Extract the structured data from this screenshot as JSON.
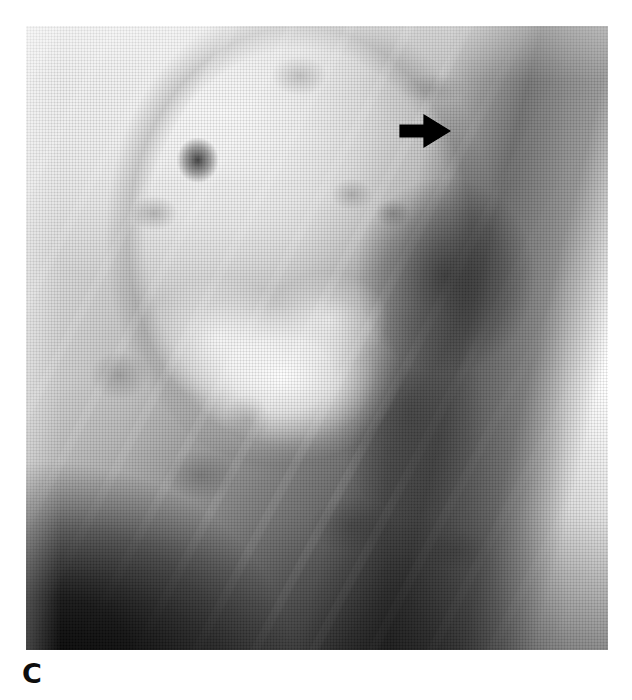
{
  "figure": {
    "panel_label": "C",
    "caption": "",
    "modality": "radiograph",
    "view": "lateral chest radiograph"
  },
  "image": {
    "name": "chest-radiograph",
    "alt_text": "Grayscale halftone chest radiograph, lateral projection",
    "frame": {
      "left": 26,
      "top": 26,
      "width": 582,
      "height": 624
    },
    "tones": {
      "background": "#ffffff",
      "film_light": "#e8e8e8",
      "film_mid": "#9e9e9e",
      "film_dark": "#232323",
      "film_black": "#000000",
      "highlight": "#ffffff"
    }
  },
  "annotations": [
    {
      "name": "arrow-marker",
      "type": "arrow",
      "direction": "right",
      "color": "#000000",
      "x": 373,
      "y": 87,
      "width": 52,
      "height": 36,
      "label": ""
    }
  ],
  "regions": [
    {
      "name": "upper-lung-field",
      "description": "lucent upper lung field"
    },
    {
      "name": "focal-nodule",
      "description": "dark rounded nodule, upper left field"
    },
    {
      "name": "hilar-mass",
      "description": "bright central hilar and mediastinal opacity"
    },
    {
      "name": "vertebral-column",
      "description": "dark paraspinal band"
    },
    {
      "name": "diaphragm-corner",
      "description": "near-black inferior region"
    },
    {
      "name": "lateral-chest-wall",
      "description": "bright right lateral soft tissue"
    }
  ]
}
